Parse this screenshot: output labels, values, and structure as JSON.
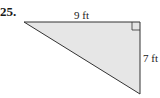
{
  "problem": {
    "number": "25."
  },
  "figure": {
    "shape": "right triangle",
    "fill_color": "#e6e6e6",
    "stroke_color": "#333333",
    "top_side_label": "9 ft",
    "right_side_label": "7 ft",
    "right_angle_marker": true
  }
}
